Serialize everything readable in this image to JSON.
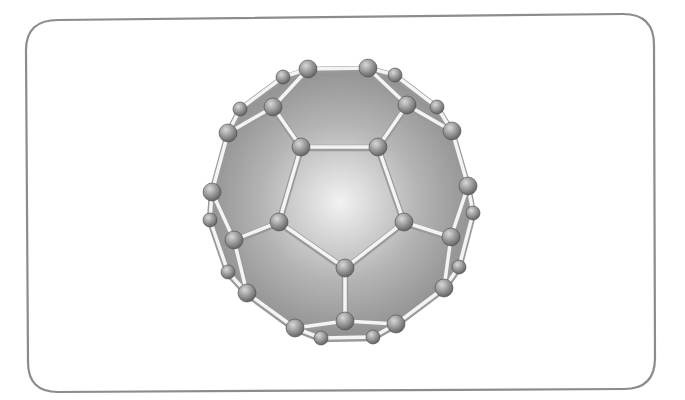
{
  "figure": {
    "atom_count": 30,
    "bond_count": 41
  },
  "colors": {
    "background": "#ffffff",
    "frame_stroke": "#8c8c8c",
    "shell_highlight": "#f2f2f2",
    "shell_mid": "#b4b4b4",
    "shell_dark": "#7a7a7a",
    "bond_light": "#f4f4f4",
    "bond_shadow": "#9a9a9a",
    "atom_light": "#d8d8d8",
    "atom_dark": "#5a5a5a"
  }
}
